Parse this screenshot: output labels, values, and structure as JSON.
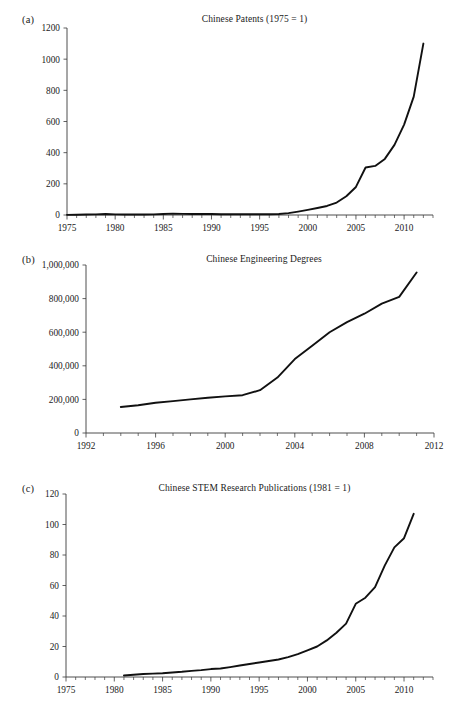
{
  "figure": {
    "background": "#ffffff",
    "line_color": "#111111",
    "axis_color": "#3a3a3a"
  },
  "panels": [
    {
      "label": "(a)",
      "title": "Chinese Patents (1975 = 1)"
    },
    {
      "label": "(b)",
      "title": "Chinese Engineering Degrees"
    },
    {
      "label": "(c)",
      "title": "Chinese STEM Research Publications (1981 = 1)"
    }
  ],
  "chart_data": [
    {
      "type": "line",
      "panel": "(a)",
      "title": "Chinese Patents (1975 = 1)",
      "xlabel": "",
      "ylabel": "",
      "xlim": [
        1975,
        2013
      ],
      "ylim": [
        0,
        1200
      ],
      "xticks": [
        1975,
        1980,
        1985,
        1990,
        1995,
        2000,
        2005,
        2010
      ],
      "xtick_labels": [
        "1975",
        "1980",
        "1985",
        "1990",
        "1995",
        "2000",
        "2005",
        "2010"
      ],
      "minor_xtick_interval": 1,
      "yticks": [
        0,
        200,
        400,
        600,
        800,
        1000,
        1200
      ],
      "ytick_labels": [
        "0",
        "200",
        "400",
        "600",
        "800",
        "1000",
        "1200"
      ],
      "grid": false,
      "legend": null,
      "x": [
        1975,
        1976,
        1977,
        1978,
        1979,
        1980,
        1981,
        1982,
        1983,
        1984,
        1985,
        1986,
        1987,
        1988,
        1989,
        1990,
        1991,
        1992,
        1993,
        1994,
        1995,
        1996,
        1997,
        1998,
        1999,
        2000,
        2001,
        2002,
        2003,
        2004,
        2005,
        2006,
        2007,
        2008,
        2009,
        2010,
        2011,
        2012
      ],
      "values": [
        1,
        2,
        3,
        4,
        6,
        4,
        3,
        3,
        3,
        4,
        6,
        9,
        7,
        6,
        6,
        6,
        5,
        5,
        5,
        5,
        5,
        5,
        6,
        12,
        22,
        33,
        45,
        58,
        80,
        120,
        180,
        305,
        315,
        360,
        450,
        580,
        760,
        1100
      ]
    },
    {
      "type": "line",
      "panel": "(b)",
      "title": "Chinese Engineering Degrees",
      "xlabel": "",
      "ylabel": "",
      "xlim": [
        1992,
        2012
      ],
      "ylim": [
        0,
        1000000
      ],
      "xticks": [
        1992,
        1996,
        2000,
        2004,
        2008,
        2012
      ],
      "xtick_labels": [
        "1992",
        "1996",
        "2000",
        "2004",
        "2008",
        "2012"
      ],
      "minor_xtick_interval": 1,
      "yticks": [
        0,
        200000,
        400000,
        600000,
        800000,
        1000000
      ],
      "ytick_labels": [
        "0",
        "200,000",
        "400,000",
        "600,000",
        "800,000",
        "1,000,000"
      ],
      "grid": false,
      "legend": null,
      "x": [
        1994,
        1995,
        1996,
        1997,
        1998,
        1999,
        2000,
        2001,
        2002,
        2003,
        2004,
        2005,
        2006,
        2007,
        2008,
        2009,
        2010,
        2011
      ],
      "values": [
        155000,
        165000,
        180000,
        190000,
        200000,
        210000,
        218000,
        225000,
        255000,
        330000,
        440000,
        520000,
        600000,
        660000,
        710000,
        770000,
        810000,
        955000
      ]
    },
    {
      "type": "line",
      "panel": "(c)",
      "title": "Chinese STEM Research Publications (1981 = 1)",
      "xlabel": "",
      "ylabel": "",
      "xlim": [
        1975,
        2013
      ],
      "ylim": [
        0,
        120
      ],
      "xticks": [
        1975,
        1980,
        1985,
        1990,
        1995,
        2000,
        2005,
        2010
      ],
      "xtick_labels": [
        "1975",
        "1980",
        "1985",
        "1990",
        "1995",
        "2000",
        "2005",
        "2010"
      ],
      "minor_xtick_interval": 1,
      "yticks": [
        0,
        20,
        40,
        60,
        80,
        100,
        120
      ],
      "ytick_labels": [
        "0",
        "20",
        "40",
        "60",
        "80",
        "100",
        "120"
      ],
      "grid": false,
      "legend": null,
      "x": [
        1981,
        1982,
        1983,
        1984,
        1985,
        1986,
        1987,
        1988,
        1989,
        1990,
        1991,
        1992,
        1993,
        1994,
        1995,
        1996,
        1997,
        1998,
        1999,
        2000,
        2001,
        2002,
        2003,
        2004,
        2005,
        2006,
        2007,
        2008,
        2009,
        2010,
        2011
      ],
      "values": [
        1,
        1.5,
        2,
        2.2,
        2.5,
        3,
        3.4,
        4,
        4.5,
        5.2,
        5.6,
        6.5,
        7.5,
        8.5,
        9.5,
        10.5,
        11.5,
        13,
        15,
        17.5,
        20,
        24,
        29,
        35,
        48,
        52,
        59,
        73,
        85,
        91,
        107
      ]
    }
  ]
}
